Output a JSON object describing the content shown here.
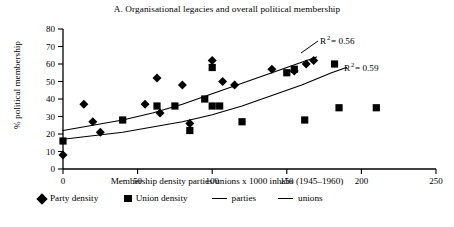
{
  "title": "A. Organisational legacies and overall political membership",
  "axes": {
    "x_label": "Membership density parties/unions x 1000 inhabs (1945–1960)",
    "y_label": "% political membership",
    "x_ticks": [
      "0",
      "50",
      "100",
      "150",
      "200",
      "250"
    ],
    "y_ticks": [
      "0",
      "10",
      "20",
      "30",
      "40",
      "50",
      "60",
      "70",
      "80"
    ]
  },
  "annotations": {
    "r2_parties_base": "R",
    "r2_parties_sup": "2",
    "r2_parties_value": "= 0.56",
    "r2_unions_base": "R",
    "r2_unions_sup": "2",
    "r2_unions_value": "= 0.59"
  },
  "legend": {
    "party_marker": "diamond-marker",
    "party_label": "Party density",
    "union_marker": "square-marker",
    "union_label": "Union density",
    "parties_line_marker": "line-marker",
    "parties_line_label": "parties",
    "unions_line_marker": "line-marker",
    "unions_line_label": "unions"
  },
  "chart_data": {
    "type": "scatter",
    "title": "A. Organisational legacies and overall political membership",
    "xlabel": "Membership density parties/unions x 1000 inhabs (1945–1960)",
    "ylabel": "% political membership",
    "xlim": [
      0,
      250
    ],
    "ylim": [
      0,
      80
    ],
    "xticks": [
      0,
      50,
      100,
      150,
      200,
      250
    ],
    "yticks": [
      0,
      10,
      20,
      30,
      40,
      50,
      60,
      70,
      80
    ],
    "grid": false,
    "legend_position": "below-axis",
    "series": [
      {
        "name": "Party density",
        "marker": "diamond",
        "color": "#000000",
        "points": [
          [
            0,
            8
          ],
          [
            14,
            37
          ],
          [
            20,
            27
          ],
          [
            25,
            21
          ],
          [
            55,
            37
          ],
          [
            63,
            52
          ],
          [
            65,
            32
          ],
          [
            80,
            48
          ],
          [
            85,
            26
          ],
          [
            100,
            62
          ],
          [
            107,
            50
          ],
          [
            115,
            48
          ],
          [
            140,
            57
          ],
          [
            155,
            56
          ],
          [
            163,
            60
          ],
          [
            168,
            62
          ]
        ]
      },
      {
        "name": "Union density",
        "marker": "square",
        "color": "#000000",
        "points": [
          [
            0,
            16
          ],
          [
            40,
            28
          ],
          [
            63,
            36
          ],
          [
            75,
            36
          ],
          [
            85,
            22
          ],
          [
            95,
            40
          ],
          [
            100,
            58
          ],
          [
            100,
            36
          ],
          [
            105,
            36
          ],
          [
            120,
            27
          ],
          [
            150,
            55
          ],
          [
            155,
            57
          ],
          [
            162,
            28
          ],
          [
            182,
            60
          ],
          [
            185,
            35
          ],
          [
            210,
            35
          ]
        ]
      }
    ],
    "fits": [
      {
        "name": "parties",
        "r_squared": 0.56,
        "label": "R2= 0.56",
        "x_range": [
          0,
          170
        ],
        "curve_points": [
          [
            0,
            22
          ],
          [
            20,
            25
          ],
          [
            40,
            28
          ],
          [
            60,
            32
          ],
          [
            80,
            37
          ],
          [
            100,
            43
          ],
          [
            120,
            49
          ],
          [
            140,
            55
          ],
          [
            160,
            61
          ],
          [
            170,
            64
          ]
        ]
      },
      {
        "name": "unions",
        "r_squared": 0.59,
        "label": "R2= 0.59",
        "x_range": [
          0,
          190
        ],
        "curve_points": [
          [
            0,
            17
          ],
          [
            20,
            19
          ],
          [
            40,
            21
          ],
          [
            60,
            24
          ],
          [
            80,
            27
          ],
          [
            100,
            31
          ],
          [
            120,
            36
          ],
          [
            140,
            42
          ],
          [
            160,
            48
          ],
          [
            180,
            55
          ],
          [
            190,
            58
          ]
        ]
      }
    ]
  }
}
